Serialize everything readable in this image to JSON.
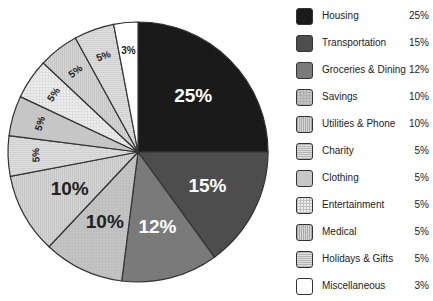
{
  "chart_data": {
    "type": "pie",
    "title": "",
    "legend_position": "right",
    "categories": [
      "Housing",
      "Transportation",
      "Groceries & Dining",
      "Savings",
      "Utilities & Phone",
      "Charity",
      "Clothing",
      "Entertainment",
      "Medical",
      "Holidays & Gifts",
      "Miscellaneous"
    ],
    "values": [
      25,
      15,
      12,
      10,
      10,
      5,
      5,
      5,
      5,
      5,
      3
    ],
    "labels": [
      "25%",
      "15%",
      "12%",
      "10%",
      "10%",
      "5%",
      "5%",
      "5%",
      "5%",
      "5%",
      "3%"
    ],
    "colors": [
      "#1a1a1a",
      "#4d4d4d",
      "#7a7a7a",
      "#c4c4c4",
      "#cdcdcd",
      "#d8d8d8",
      "#c6c6c6",
      "#e6e6e6",
      "#efefef",
      "#f2f2f2",
      "#ffffff"
    ],
    "patterns": [
      "solid",
      "solid",
      "solid",
      "fine-grid",
      "vertical-lines",
      "horizontal-lines",
      "solid",
      "grid",
      "vertical-lines",
      "horizontal-lines",
      "solid"
    ],
    "label_colors": [
      "#ffffff",
      "#ffffff",
      "#ffffff",
      "#222222",
      "#222222",
      "#222222",
      "#222222",
      "#222222",
      "#222222",
      "#222222",
      "#222222"
    ],
    "start_angle_deg": 0,
    "direction": "clockwise"
  },
  "legend": {
    "items": [
      {
        "label": "Housing",
        "pct": "25%"
      },
      {
        "label": "Transportation",
        "pct": "15%"
      },
      {
        "label": "Groceries & Dining",
        "pct": "12%"
      },
      {
        "label": "Savings",
        "pct": "10%"
      },
      {
        "label": "Utilities & Phone",
        "pct": "10%"
      },
      {
        "label": "Charity",
        "pct": "5%"
      },
      {
        "label": "Clothing",
        "pct": "5%"
      },
      {
        "label": "Entertainment",
        "pct": "5%"
      },
      {
        "label": "Medical",
        "pct": "5%"
      },
      {
        "label": "Holidays & Gifts",
        "pct": "5%"
      },
      {
        "label": "Miscellaneous",
        "pct": "3%"
      }
    ]
  }
}
